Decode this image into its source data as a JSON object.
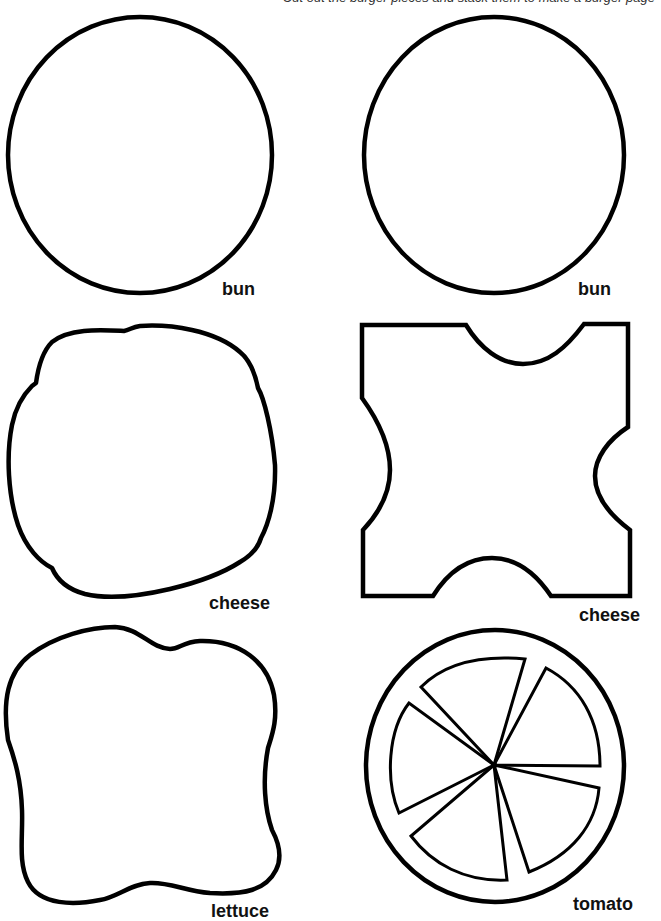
{
  "page": {
    "header_text": "Cut out the burger pieces and stack them to make a burger page"
  },
  "pieces": [
    {
      "id": "bun-left",
      "label": "bun"
    },
    {
      "id": "bun-right",
      "label": "bun"
    },
    {
      "id": "cheese-left",
      "label": "cheese"
    },
    {
      "id": "cheese-right",
      "label": "cheese"
    },
    {
      "id": "lettuce",
      "label": "lettuce"
    },
    {
      "id": "tomato",
      "label": "tomato"
    }
  ],
  "style": {
    "stroke_color": "#000000",
    "background": "#ffffff"
  }
}
